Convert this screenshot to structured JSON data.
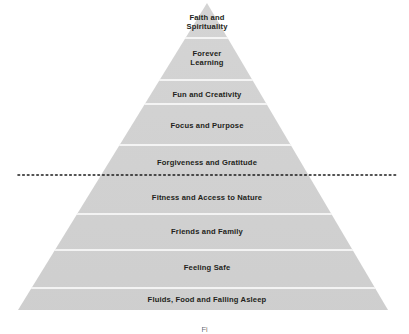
{
  "diagram": {
    "type": "pyramid",
    "colors": {
      "fill": "#d0d0d0",
      "fill_light": "#d9d9d9",
      "divider": "#ffffff",
      "text": "#231f20",
      "dotted_line": "#1a1a1a",
      "background": "#ffffff",
      "caption_text": "#6f6f6f"
    },
    "geometry": {
      "apex_x": 207,
      "apex_y": 3,
      "base_left_x": 18,
      "base_right_x": 388,
      "base_y": 310
    },
    "divider_line": {
      "style": "dotted",
      "start_x": 18,
      "end_x": 396,
      "y": 175,
      "between_tiers": [
        5,
        6
      ]
    },
    "tiers": [
      {
        "index": 1,
        "label": "Faith and\nSpirituality",
        "top_y": 3,
        "bottom_y": 38,
        "label_x": 207,
        "label_y": 22
      },
      {
        "index": 2,
        "label": "Forever\nLearning",
        "top_y": 38,
        "bottom_y": 80,
        "label_x": 207,
        "label_y": 58
      },
      {
        "index": 3,
        "label": "Fun and Creativity",
        "top_y": 80,
        "bottom_y": 104,
        "label_x": 207,
        "label_y": 95
      },
      {
        "index": 4,
        "label": "Focus and Purpose",
        "top_y": 104,
        "bottom_y": 145,
        "label_x": 207,
        "label_y": 126
      },
      {
        "index": 5,
        "label": "Forgiveness and Gratitude",
        "top_y": 145,
        "bottom_y": 175,
        "label_x": 207,
        "label_y": 163
      },
      {
        "index": 6,
        "label": "Fitness and Access to Nature",
        "top_y": 175,
        "bottom_y": 214,
        "label_x": 207,
        "label_y": 198
      },
      {
        "index": 7,
        "label": "Friends and Family",
        "top_y": 214,
        "bottom_y": 250,
        "label_x": 207,
        "label_y": 232
      },
      {
        "index": 8,
        "label": "Feeling Safe",
        "top_y": 250,
        "bottom_y": 288,
        "label_x": 207,
        "label_y": 268
      },
      {
        "index": 9,
        "label": "Fluids, Food and Falling Asleep",
        "top_y": 288,
        "bottom_y": 310,
        "label_x": 207,
        "label_y": 300
      }
    ],
    "caption": {
      "text": "Fi",
      "y": 325,
      "clipped": true
    }
  }
}
